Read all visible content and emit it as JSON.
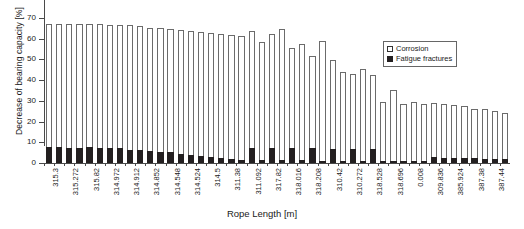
{
  "chart_data": {
    "type": "bar",
    "subtype": "stacked",
    "title": "",
    "xlabel": "Rope Length [m]",
    "ylabel": "Decrease of bearing capacity [%]",
    "ylim": [
      0,
      70
    ],
    "yticks": [
      0,
      10,
      20,
      30,
      40,
      50,
      60,
      70
    ],
    "grid": false,
    "legend_position": "top-right",
    "legend": [
      "Corrosion",
      "Fatigue fractures"
    ],
    "categories": [
      "315.3",
      "",
      "315.272",
      "",
      "315.82",
      "",
      "314.972",
      "",
      "314.912",
      "",
      "314.852",
      "",
      "314.548",
      "",
      "314.524",
      "",
      "314.5",
      "",
      "311.38",
      "",
      "311.092",
      "",
      "317.82",
      "",
      "318.016",
      "",
      "318.208",
      "",
      "310.42",
      "",
      "310.272",
      "",
      "318.528",
      "",
      "318.696",
      "",
      "0.008",
      "",
      "309.836",
      "",
      "385.924",
      "",
      "387.38",
      "",
      "387.44",
      ""
    ],
    "tick_labels": [
      "315.3",
      "315.272",
      "315.82",
      "314.972",
      "314.912",
      "314.852",
      "314.548",
      "314.524",
      "314.5",
      "311.38",
      "311.092",
      "317.82",
      "318.016",
      "318.208",
      "310.42",
      "310.272",
      "318.528",
      "318.696",
      "0.008",
      "309.836",
      "385.924",
      "387.38",
      "387.44"
    ],
    "series": [
      {
        "name": "Fatigue fractures",
        "color": "#231f20",
        "values": [
          7.8,
          7.8,
          7.4,
          7.4,
          7.5,
          7.4,
          7.2,
          7.1,
          6.4,
          6.1,
          5.6,
          5.4,
          5.1,
          4.4,
          4.1,
          3.5,
          3.1,
          2.2,
          1.8,
          1.5,
          7.4,
          1.4,
          7.4,
          1.3,
          7.3,
          1.4,
          7.2,
          1.2,
          7.0,
          1.2,
          6.9,
          1.1,
          6.8,
          1.0,
          0.9,
          0.8,
          0.7,
          0.6,
          2.9,
          2.5,
          2.4,
          2.3,
          2.2,
          2.1,
          1.9,
          1.8
        ]
      },
      {
        "name": "Corrosion",
        "color": "#ffffff",
        "values": [
          59.2,
          59.2,
          59.6,
          59.6,
          59.4,
          59.5,
          59.6,
          59.6,
          60.1,
          60.2,
          59.6,
          59.6,
          59.4,
          59.7,
          59.4,
          59.7,
          59.5,
          60.1,
          59.8,
          59.6,
          56.1,
          57.0,
          55.0,
          63.5,
          48.2,
          55.9,
          44.6,
          57.6,
          42.9,
          42.9,
          36.1,
          44.1,
          35.5,
          28.6,
          34.2,
          27.5,
          28.4,
          27.5,
          26.3,
          26.2,
          25.4,
          25.3,
          23.9,
          23.8,
          23.3,
          22.2
        ]
      }
    ],
    "totals": [
      67.0,
      67.0,
      67.0,
      67.0,
      66.9,
      66.9,
      66.8,
      66.7,
      66.5,
      66.3,
      65.2,
      65.0,
      64.5,
      64.1,
      63.5,
      63.2,
      62.6,
      62.3,
      61.6,
      61.1,
      63.5,
      58.4,
      62.4,
      64.8,
      55.5,
      57.3,
      51.8,
      58.8,
      49.9,
      44.1,
      43.0,
      45.2,
      42.3,
      29.6,
      35.1,
      28.3,
      29.1,
      28.1,
      29.2,
      28.7,
      27.8,
      27.6,
      26.1,
      25.9,
      25.2,
      24.0
    ]
  }
}
